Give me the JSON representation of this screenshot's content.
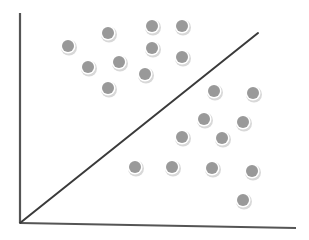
{
  "diagram": {
    "type": "scatter-with-decision-boundary",
    "colors": {
      "background": "#ffffff",
      "axis": "#555555",
      "boundary": "#3a3a3a",
      "dot_fill": "#999999",
      "dot_rim": "#d8d8d8"
    },
    "axes": {
      "origin": [
        20,
        223
      ],
      "y_top": [
        20,
        13
      ],
      "x_end": [
        296,
        228
      ]
    },
    "boundary_line": {
      "from": [
        20,
        223
      ],
      "to": [
        258,
        33
      ]
    },
    "dot_radius": 7,
    "points_above": [
      [
        68,
        46
      ],
      [
        108,
        33
      ],
      [
        88,
        67
      ],
      [
        119,
        62
      ],
      [
        108,
        88
      ],
      [
        152,
        26
      ],
      [
        182,
        26
      ],
      [
        152,
        48
      ],
      [
        182,
        57
      ],
      [
        145,
        74
      ]
    ],
    "points_below": [
      [
        214,
        91
      ],
      [
        253,
        93
      ],
      [
        204,
        119
      ],
      [
        243,
        122
      ],
      [
        222,
        138
      ],
      [
        182,
        137
      ],
      [
        135,
        167
      ],
      [
        172,
        167
      ],
      [
        212,
        168
      ],
      [
        252,
        171
      ],
      [
        243,
        200
      ]
    ]
  }
}
